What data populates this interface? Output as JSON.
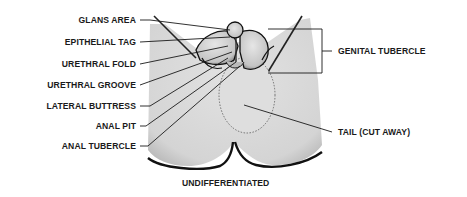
{
  "diagram": {
    "title": "UNDIFFERENTIATED",
    "left_labels": [
      {
        "id": "glans-area",
        "text": "GLANS AREA"
      },
      {
        "id": "epithelial-tag",
        "text": "EPITHELIAL TAG"
      },
      {
        "id": "urethral-fold",
        "text": "URETHRAL FOLD"
      },
      {
        "id": "urethral-groove",
        "text": "URETHRAL GROOVE"
      },
      {
        "id": "lateral-buttress",
        "text": "LATERAL BUTTRESS"
      },
      {
        "id": "anal-pit",
        "text": "ANAL PIT"
      },
      {
        "id": "anal-tubercle",
        "text": "ANAL TUBERCLE"
      }
    ],
    "right_labels": [
      {
        "id": "genital-tubercle",
        "text": "GENITAL TUBERCLE"
      },
      {
        "id": "tail-cut-away",
        "text": "TAIL (CUT AWAY)"
      }
    ],
    "colors": {
      "background": "#ffffff",
      "shading": "#d9d9d9",
      "ink": "#1a1a1a"
    }
  }
}
